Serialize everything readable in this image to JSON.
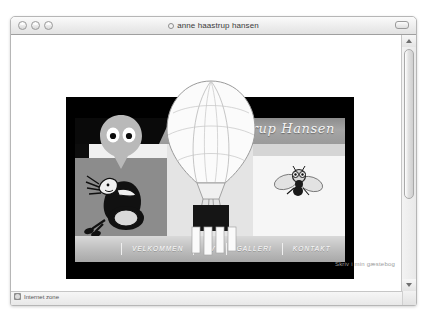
{
  "window": {
    "title": "anne haastrup hansen",
    "controls": [
      "close-button",
      "minimize-button",
      "zoom-button"
    ],
    "toolbar_toggle_label": ""
  },
  "statusbar": {
    "zone_label": "Internet zone"
  },
  "site": {
    "logo_text": "Haastrup Hansen",
    "nav": [
      {
        "label": "VELKOMMEN"
      },
      {
        "label": "CV"
      },
      {
        "label": "GALLERI"
      },
      {
        "label": "KONTAKT"
      }
    ],
    "guestbook_link": "Skriv i min gæstebog"
  },
  "colors": {
    "window_chrome": "#ededed",
    "site_frame": "#000000",
    "nav_bar": "#bfbfbf",
    "panel_gray": "#8c8c8c",
    "text_light": "#ffffff",
    "status_text": "#565656",
    "guestbook_text": "#9b9b9b"
  }
}
